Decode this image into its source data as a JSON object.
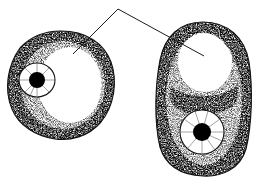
{
  "figure": {
    "name": "two-cells-stippled-line-drawing",
    "background_color": "#ffffff",
    "ink_color": "#000000",
    "stipple_color": "#1a1a1a",
    "width": 261,
    "height": 183,
    "caption": {
      "text": "",
      "visible": false,
      "note": "label text is cropped off above the top edge; only faint descender fragments remain"
    }
  },
  "leader": {
    "name": "leader-line",
    "apex": {
      "x": 118,
      "y": 9
    },
    "branches": [
      {
        "name": "leader-to-left-cell",
        "end_x": 73,
        "end_y": 54
      },
      {
        "name": "leader-to-right-cell",
        "end_x": 204,
        "end_y": 56
      }
    ],
    "stroke_width": 1,
    "color": "#1c1c1c"
  },
  "cells": [
    {
      "id": "left-cell",
      "label": "left cell",
      "shape": "rounded irregular circle",
      "center": {
        "x": 61,
        "y": 85
      },
      "radius_x": 53,
      "radius_y": 54,
      "nucleus": {
        "label": "nucleus",
        "center": {
          "x": 37,
          "y": 80
        },
        "radius_x": 18,
        "radius_y": 17,
        "nucleolus": {
          "label": "nucleolus",
          "center": {
            "x": 37,
            "y": 80
          },
          "radius": 8,
          "color": "#000000"
        },
        "spokes": 9
      },
      "vacuole": {
        "label": "vacuole",
        "center": {
          "x": 70,
          "y": 85
        },
        "radius_x": 32,
        "radius_y": 38
      }
    },
    {
      "id": "right-cell",
      "label": "right cell",
      "shape": "elongated oval",
      "center": {
        "x": 203,
        "y": 99
      },
      "radius_x": 47,
      "radius_y": 77,
      "nucleus": {
        "label": "nucleus",
        "center": {
          "x": 202,
          "y": 132
        },
        "radius_x": 22,
        "radius_y": 22,
        "nucleolus": {
          "label": "nucleolus",
          "center": {
            "x": 202,
            "y": 132
          },
          "radius": 9,
          "color": "#000000"
        },
        "spokes": 10
      },
      "vacuole": {
        "label": "vacuole",
        "center": {
          "x": 205,
          "y": 62
        },
        "radius_x": 27,
        "radius_y": 30
      }
    }
  ]
}
